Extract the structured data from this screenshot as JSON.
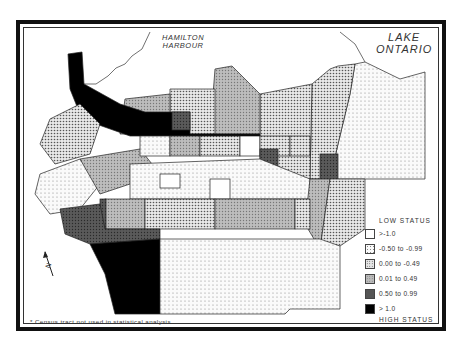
{
  "map": {
    "water_labels": {
      "harbour": [
        "HAMILTON",
        "HARBOUR"
      ],
      "lake": [
        "LAKE",
        "ONTARIO"
      ]
    },
    "north_arrow_label": "N",
    "census_tract_marker": "*",
    "footnote": "* Census tract not used in statistical analysis.",
    "classes": {
      "c1": {
        "range": "> -1.0",
        "fill": "#ffffff"
      },
      "c2": {
        "range": "-0.50 to -0.99",
        "fill": "light-dots"
      },
      "c3": {
        "range": "0.00 to -0.49",
        "fill": "medium-dots"
      },
      "c4": {
        "range": "0.01 to 0.49",
        "fill": "gray-dots"
      },
      "c5": {
        "range": "0.50 to 0.99",
        "fill": "dark-gray"
      },
      "c6": {
        "range": "> 1.0",
        "fill": "#000000"
      }
    }
  },
  "legend": {
    "top_label": "LOW STATUS",
    "bottom_label": "HIGH STATUS",
    "items": [
      {
        "label": ">-1.0"
      },
      {
        "label": "-0.50 to -0.99"
      },
      {
        "label": "0.00 to -0.49"
      },
      {
        "label": "0.01 to 0.49"
      },
      {
        "label": "0.50 to 0.99"
      },
      {
        "label": "> 1.0"
      }
    ]
  }
}
